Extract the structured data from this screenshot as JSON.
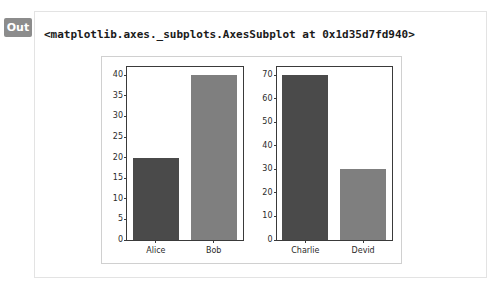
{
  "output": {
    "prompt_label": "Out",
    "repr_text": "<matplotlib.axes._subplots.AxesSubplot at 0x1d35d7fd940>"
  },
  "colors": {
    "bar_dark": "#4a4a4a",
    "bar_light": "#7f7f7f",
    "badge_bg": "#8c8c8c",
    "card_border": "#e3e3e3",
    "figure_border": "#d0d0d0",
    "axes_spine": "#3a3a3a"
  },
  "chart_data": [
    {
      "type": "bar",
      "title": "",
      "xlabel": "",
      "ylabel": "",
      "categories": [
        "Alice",
        "Bob"
      ],
      "values": [
        20,
        40
      ],
      "bar_colors": [
        "#4a4a4a",
        "#7f7f7f"
      ],
      "ylim": [
        0,
        42
      ],
      "yticks": [
        0,
        5,
        10,
        15,
        20,
        25,
        30,
        35,
        40
      ],
      "ytick_labels": [
        "0",
        "5",
        "10",
        "15",
        "20",
        "25",
        "30",
        "35",
        "40"
      ],
      "grid": false,
      "legend": false
    },
    {
      "type": "bar",
      "title": "",
      "xlabel": "",
      "ylabel": "",
      "categories": [
        "Charlie",
        "Devid"
      ],
      "values": [
        70,
        30
      ],
      "bar_colors": [
        "#4a4a4a",
        "#7f7f7f"
      ],
      "ylim": [
        0,
        73.5
      ],
      "yticks": [
        0,
        10,
        20,
        30,
        40,
        50,
        60,
        70
      ],
      "ytick_labels": [
        "0",
        "10",
        "20",
        "30",
        "40",
        "50",
        "60",
        "70"
      ],
      "grid": false,
      "legend": false
    }
  ]
}
